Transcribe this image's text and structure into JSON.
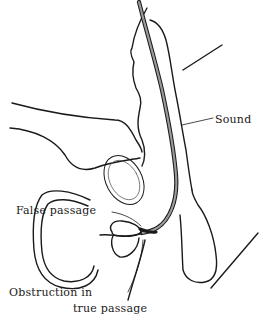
{
  "figure": {
    "colors": {
      "ink": "#1a1a1a",
      "background": "#ffffff",
      "sound_fill": "#9a9a9a"
    }
  },
  "labels": {
    "sound": "Sound",
    "false_passage": "False passage",
    "obstruction_line1": "Obstruction in",
    "obstruction_line2": "true passage"
  }
}
